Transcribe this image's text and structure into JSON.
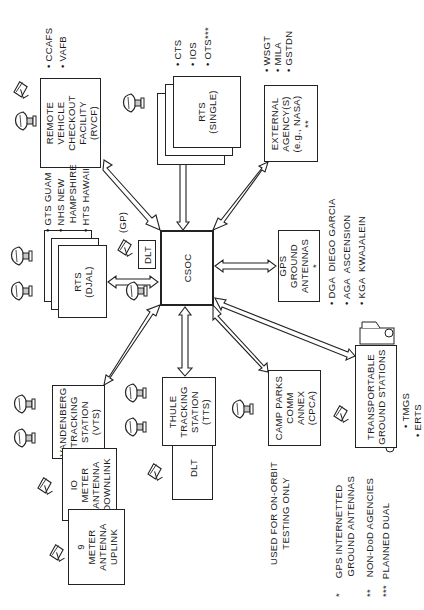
{
  "diagram": {
    "orientation": "rotated 90 degrees counter-clockwise",
    "center_node": {
      "label": "CSOC"
    },
    "nodes": {
      "rvcf": {
        "label": "REMOTE\nVEHICLE\nCHECKOUT\nFACILITY\n(RVCF)",
        "sites": [
          "• CCAFS",
          "• VAFB"
        ]
      },
      "rts_single": {
        "label": "RTS\n(SINGLE)",
        "sites": [
          "• CTS",
          "• IOS",
          "• OTS***"
        ]
      },
      "external_agency": {
        "label": "EXTERNAL\nAGENCY(S)\n(e.g., NASA)\n**",
        "sites": [
          "• WSGT",
          "• MILA",
          "• GSTDN"
        ]
      },
      "rts_djal": {
        "label": "RTS\n(DJAL)",
        "sites": [
          "• GTS GUAM",
          "• NHS NEW\n   HAMPSHIRE",
          "• HTS HAWAII"
        ]
      },
      "dlt_gp": {
        "label": "DLT",
        "note": "(GP)"
      },
      "gps_ground": {
        "label": "GPS\nGROUND\nANTENNAS\n*",
        "sites": [
          "• DGA  DIEGO GARCIA",
          "• AGA  ASCENSION",
          "• KGA  KWAJALEIN"
        ]
      },
      "vts": {
        "label": "VANDENBERG\nTRACKING\nSTATION\n(VTS)"
      },
      "downlink_10m": {
        "label": "IO\nMETER\nANTENNA\nDOWNLINK"
      },
      "uplink_9m": {
        "label": "9\nMETER\nANTENNA\nUPLINK"
      },
      "tts": {
        "label": "THULE\nTRACKING\nSTATION\n(TTS)"
      },
      "dlt_tts": {
        "label": "DLT"
      },
      "cpca": {
        "label": "CAMP PARKS\nCOMM\nANNEX\n(CPCA)",
        "note": "USED FOR ON-ORBIT\nTESTING ONLY"
      },
      "transportable": {
        "label": "TRANSPORTABLE\nGROUND STATIONS",
        "sites": [
          "• TMGS",
          "• ERTS"
        ]
      }
    },
    "legend": [
      "*     GPS INTERNETTED\n       GROUND ANTENNAS",
      "**    NON-DoD AGENCIES",
      "***  PLANNED DUAL"
    ],
    "colors": {
      "line": "#222222",
      "background": "#ffffff"
    }
  }
}
